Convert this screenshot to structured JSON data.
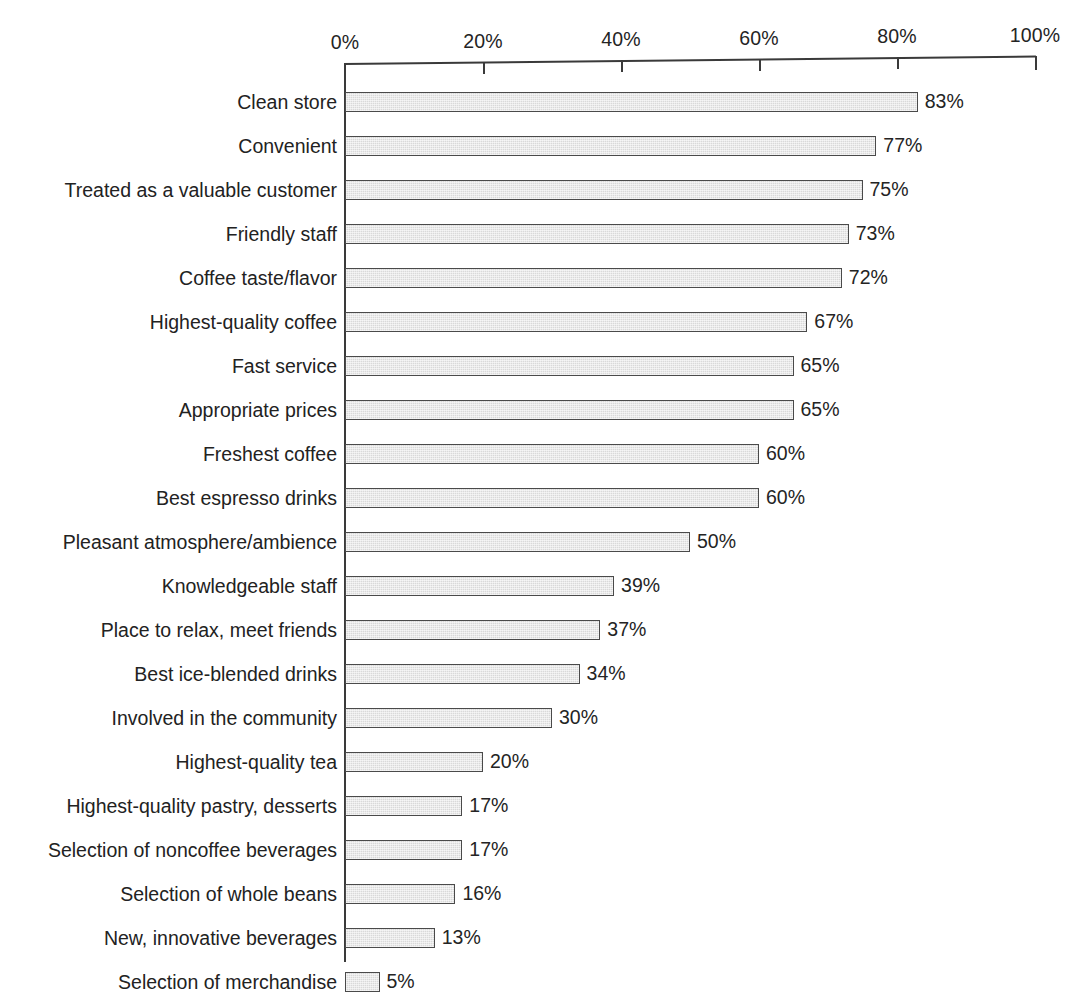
{
  "chart_data": {
    "type": "bar",
    "orientation": "horizontal",
    "title": "",
    "subtitle": "",
    "xlabel": "",
    "ylabel": "",
    "xlim": [
      0,
      100
    ],
    "grid": false,
    "legend": null,
    "axis_position": "top",
    "value_suffix": "%",
    "tick_labels": [
      "0%",
      "20%",
      "40%",
      "60%",
      "80%",
      "100%"
    ],
    "ticks": [
      0,
      20,
      40,
      60,
      80,
      100
    ],
    "categories": [
      "Clean store",
      "Convenient",
      "Treated as a valuable customer",
      "Friendly staff",
      "Coffee taste/flavor",
      "Highest-quality coffee",
      "Fast service",
      "Appropriate prices",
      "Freshest coffee",
      "Best espresso drinks",
      "Pleasant atmosphere/ambience",
      "Knowledgeable staff",
      "Place to relax, meet friends",
      "Best ice-blended drinks",
      "Involved in the community",
      "Highest-quality tea",
      "Highest-quality pastry, desserts",
      "Selection of noncoffee beverages",
      "Selection of whole beans",
      "New, innovative beverages",
      "Selection of merchandise"
    ],
    "values": [
      83,
      77,
      75,
      73,
      72,
      67,
      65,
      65,
      60,
      60,
      50,
      39,
      37,
      34,
      30,
      20,
      17,
      17,
      16,
      13,
      5
    ],
    "value_labels": [
      "83%",
      "77%",
      "75%",
      "73%",
      "72%",
      "67%",
      "65%",
      "65%",
      "60%",
      "60%",
      "50%",
      "39%",
      "37%",
      "34%",
      "30%",
      "20%",
      "17%",
      "17%",
      "16%",
      "13%",
      "5%"
    ],
    "colors": {
      "bar_fill": "#d9d9d9",
      "bar_border": "#4a4a4a",
      "axis": "#3a3a3a",
      "text": "#222222",
      "background": "#ffffff"
    }
  }
}
